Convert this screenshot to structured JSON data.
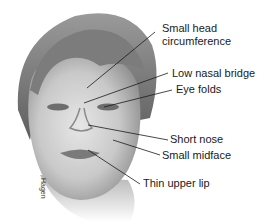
{
  "figure": {
    "signature": "Hagen",
    "labels": [
      {
        "id": "head",
        "text_lines": [
          "Small head",
          "circumference"
        ]
      },
      {
        "id": "nasal-bridge",
        "text": "Low nasal bridge"
      },
      {
        "id": "eye-folds",
        "text": "Eye folds"
      },
      {
        "id": "short-nose",
        "text": "Short nose"
      },
      {
        "id": "midface",
        "text": "Small midface"
      },
      {
        "id": "upper-lip",
        "text": "Thin upper lip"
      }
    ]
  }
}
